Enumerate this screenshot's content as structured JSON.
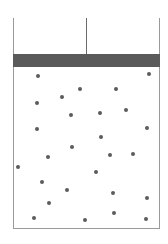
{
  "diagram": {
    "type": "gas-in-piston-container",
    "colors": {
      "piston": "#5a5a5a",
      "wall": "#9a9a9a",
      "particle": "#5c5c5c",
      "rod": "#6a6a6a"
    },
    "container": {
      "left": 13,
      "right": 159,
      "top": 18,
      "bottom": 228
    },
    "piston": {
      "top": 54,
      "bottom": 67
    },
    "rod": {
      "x": 86,
      "top": 18,
      "bottom": 54
    },
    "particles": [
      {
        "x": 38,
        "y": 76
      },
      {
        "x": 149,
        "y": 74
      },
      {
        "x": 80,
        "y": 89
      },
      {
        "x": 116,
        "y": 89
      },
      {
        "x": 62,
        "y": 97
      },
      {
        "x": 37,
        "y": 103
      },
      {
        "x": 71,
        "y": 115
      },
      {
        "x": 100,
        "y": 113
      },
      {
        "x": 126,
        "y": 110
      },
      {
        "x": 37,
        "y": 129
      },
      {
        "x": 147,
        "y": 128
      },
      {
        "x": 101,
        "y": 137
      },
      {
        "x": 72,
        "y": 147
      },
      {
        "x": 48,
        "y": 157
      },
      {
        "x": 110,
        "y": 155
      },
      {
        "x": 133,
        "y": 154
      },
      {
        "x": 18,
        "y": 167
      },
      {
        "x": 96,
        "y": 172
      },
      {
        "x": 42,
        "y": 182
      },
      {
        "x": 67,
        "y": 190
      },
      {
        "x": 113,
        "y": 193
      },
      {
        "x": 147,
        "y": 198
      },
      {
        "x": 49,
        "y": 203
      },
      {
        "x": 34,
        "y": 218
      },
      {
        "x": 85,
        "y": 220
      },
      {
        "x": 114,
        "y": 213
      },
      {
        "x": 146,
        "y": 219
      }
    ]
  }
}
